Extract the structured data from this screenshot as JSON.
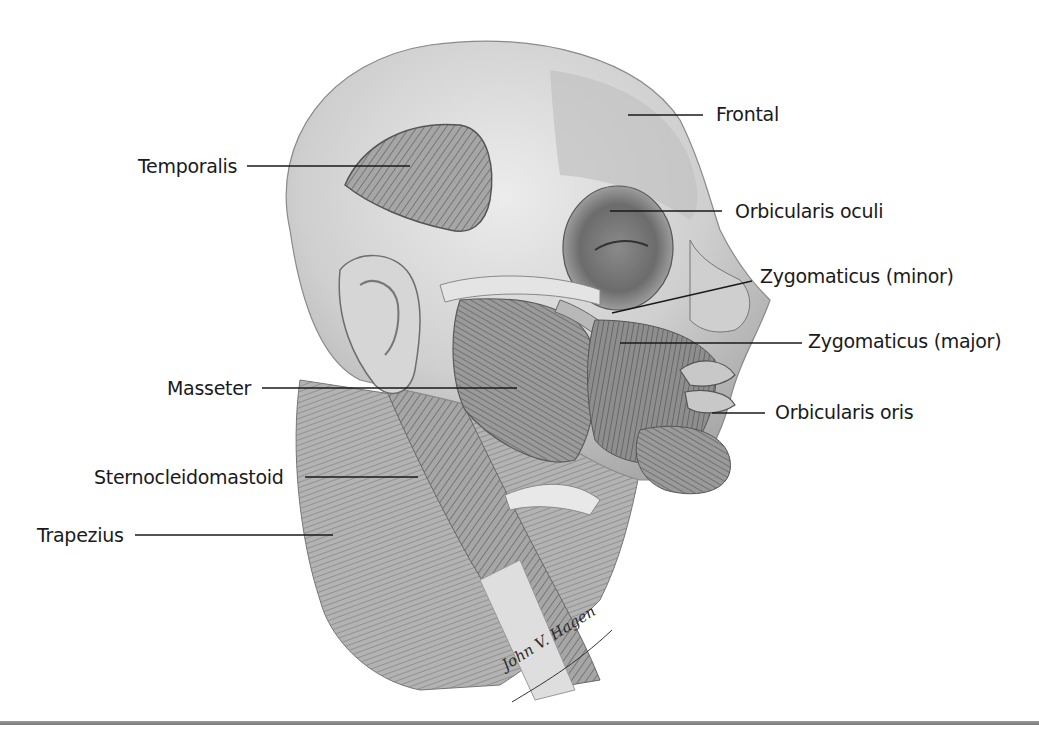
{
  "figure": {
    "labels": [
      {
        "id": "frontal",
        "text": "Frontal",
        "side": "right"
      },
      {
        "id": "temporalis",
        "text": "Temporalis",
        "side": "left"
      },
      {
        "id": "orbicularis-oculi",
        "text": "Orbicularis oculi",
        "side": "right"
      },
      {
        "id": "zygomaticus-minor",
        "text": "Zygomaticus (minor)",
        "side": "right"
      },
      {
        "id": "zygomaticus-major",
        "text": "Zygomaticus (major)",
        "side": "right"
      },
      {
        "id": "masseter",
        "text": "Masseter",
        "side": "left"
      },
      {
        "id": "orbicularis-oris",
        "text": "Orbicularis oris",
        "side": "right"
      },
      {
        "id": "sternocleidomastoid",
        "text": "Sternocleidomastoid",
        "side": "left"
      },
      {
        "id": "trapezius",
        "text": "Trapezius",
        "side": "left"
      }
    ],
    "signature": "John V. Hagen",
    "colors": {
      "background": "#ffffff",
      "label_text": "#1a1a1a",
      "leader_line": "#1a1a1a",
      "skin_light": "#d9d9d9",
      "muscle_mid": "#9a9a9a",
      "muscle_dark": "#5e5e5e",
      "bottom_rule": "#8a8a8a"
    }
  }
}
